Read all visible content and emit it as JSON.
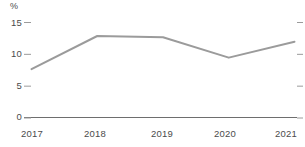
{
  "chart_data": {
    "type": "line",
    "title": "",
    "subtitle": "",
    "xlabel": "",
    "ylabel": "%",
    "unit_label": "%",
    "categories": [
      "2017",
      "2018",
      "2019",
      "2020",
      "2021"
    ],
    "x": [
      2017,
      2018,
      2019,
      2020,
      2021
    ],
    "series": [
      {
        "name": "",
        "values": [
          7.6,
          12.8,
          12.6,
          9.4,
          11.9
        ],
        "color": "#9b9b9b"
      }
    ],
    "values": [
      7.6,
      12.8,
      12.6,
      9.4,
      11.9
    ],
    "ylim": [
      0,
      15
    ],
    "yticks": [
      0,
      5,
      10,
      15
    ],
    "ytick_labels": [
      "0",
      "5",
      "10",
      "15"
    ],
    "xtick_labels": [
      "2017",
      "2018",
      "2019",
      "2020",
      "2021"
    ],
    "grid": false,
    "legend": false,
    "legend_position": "none",
    "right_axis_ticks": true,
    "baseline_color": "#6e6e6e",
    "tick_color": "#9b9b9b",
    "text_color": "#4b4b4b",
    "line_width": 2
  },
  "axes": {
    "y_ticks": [
      {
        "label": "15",
        "value": 15
      },
      {
        "label": "10",
        "value": 10
      },
      {
        "label": "5",
        "value": 5
      },
      {
        "label": "0",
        "value": 0
      }
    ],
    "x_ticks": [
      {
        "label": "2017"
      },
      {
        "label": "2018"
      },
      {
        "label": "2019"
      },
      {
        "label": "2020"
      },
      {
        "label": "2021"
      }
    ],
    "unit": "%"
  }
}
